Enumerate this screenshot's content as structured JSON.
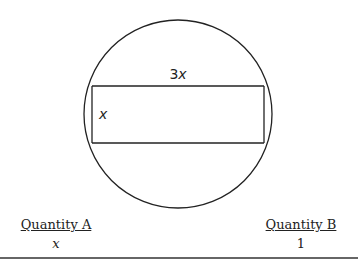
{
  "figure": {
    "shape": "rectangle inscribed in circle",
    "circle": {
      "cx": 178,
      "cy": 114,
      "r": 94
    },
    "rectangle": {
      "x": 92,
      "y": 86,
      "width": 172,
      "height": 57
    },
    "labels": {
      "top_side_coeff": "3",
      "top_side_var": "x",
      "left_side": "x"
    }
  },
  "comparison": {
    "quantity_a": {
      "heading": "Quantity A",
      "value": "x"
    },
    "quantity_b": {
      "heading": "Quantity B",
      "value": "1"
    }
  }
}
